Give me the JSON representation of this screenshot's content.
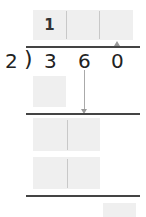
{
  "problem": {
    "divisor": "2",
    "bracket": ")",
    "dividend_digits": [
      "3",
      "6",
      "0"
    ]
  },
  "quotient": {
    "cells": [
      "1",
      "",
      ""
    ]
  },
  "work_rows": [
    {
      "cells": [
        ""
      ]
    },
    {
      "cells": [
        "",
        ""
      ]
    },
    {
      "cells": [
        "",
        ""
      ]
    }
  ],
  "remainder": {
    "cells": [
      ""
    ]
  },
  "colors": {
    "box_fill": "#efefef",
    "line": "#444444",
    "arrow": "#999999"
  }
}
